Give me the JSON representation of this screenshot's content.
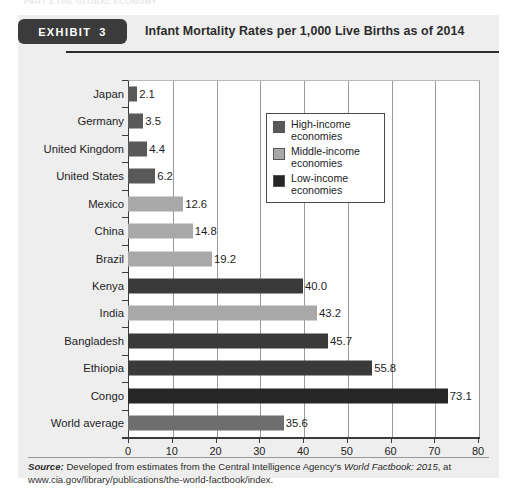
{
  "running_head": "PART 1  THE GLOBAL ECONOMY",
  "exhibit": {
    "tag_word": "EXHIBIT",
    "tag_number": "3",
    "title": "Infant Mortality Rates per 1,000 Live Births as of 2014"
  },
  "legend": {
    "items": [
      {
        "label_line1": "High-income",
        "label_line2": "economies",
        "color": "#595959"
      },
      {
        "label_line1": "Middle-income",
        "label_line2": "economies",
        "color": "#a8a8a8"
      },
      {
        "label_line1": "Low-income",
        "label_line2": "economies",
        "color": "#262626"
      }
    ]
  },
  "source": {
    "label": "Source:",
    "text_1": " Developed from estimates from the Central Intelligence Agency's ",
    "italic_1": "World Factbook: 2015",
    "text_2": ", at www.cia.gov/library/publications/the-world-factbook/index."
  },
  "chart_data": {
    "type": "bar",
    "orientation": "horizontal",
    "title": "Infant Mortality Rates per 1,000 Live Births as of 2014",
    "xlabel": "",
    "ylabel": "",
    "xlim": [
      0,
      80
    ],
    "xticks": [
      0,
      10,
      20,
      30,
      40,
      50,
      60,
      70,
      80
    ],
    "xtick_labels": [
      "0",
      "10",
      "20",
      "30",
      "40",
      "50",
      "60",
      "70",
      "80"
    ],
    "grid": "vertical",
    "legend_position": "upper-right-inside",
    "categories": [
      "Japan",
      "Germany",
      "United Kingdom",
      "United States",
      "Mexico",
      "China",
      "Brazil",
      "Kenya",
      "India",
      "Bangladesh",
      "Ethiopia",
      "Congo",
      "World average"
    ],
    "values": [
      2.1,
      3.5,
      4.4,
      6.2,
      12.6,
      14.8,
      19.2,
      40.0,
      43.2,
      45.7,
      55.8,
      73.1,
      35.6
    ],
    "value_labels": [
      "2.1",
      "3.5",
      "4.4",
      "6.2",
      "12.6",
      "14.8",
      "19.2",
      "40.0",
      "43.2",
      "45.7",
      "55.8",
      "73.1",
      "35.6"
    ],
    "groups": [
      "High-income economies",
      "High-income economies",
      "High-income economies",
      "High-income economies",
      "Middle-income economies",
      "Middle-income economies",
      "Middle-income economies",
      "Low-income economies",
      "Middle-income economies",
      "Low-income economies",
      "Low-income economies",
      "Low-income economies",
      "High-income economies"
    ],
    "bar_colors": [
      "#595959",
      "#595959",
      "#595959",
      "#595959",
      "#a8a8a8",
      "#a8a8a8",
      "#a8a8a8",
      "#3a3a3a",
      "#a8a8a8",
      "#3a3a3a",
      "#3a3a3a",
      "#262626",
      "#6e6e6e"
    ]
  }
}
